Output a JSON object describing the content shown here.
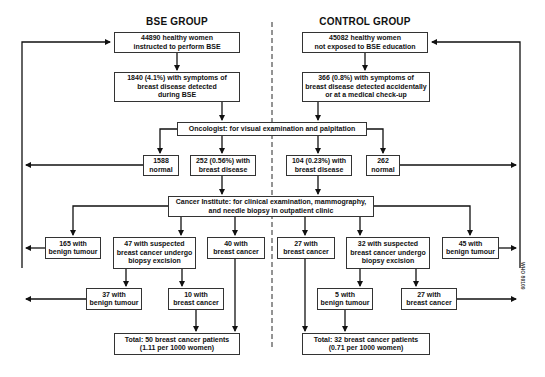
{
  "groups": {
    "bse": {
      "title": "BSE GROUP",
      "start": "44890 healthy women\ninstructed to perform BSE",
      "symptoms": "1840 (4.1%) with symptoms of\nbreast disease detected\nduring BSE",
      "normal": "1588\nnormal",
      "disease": "252 (0.56%) with\nbreast disease",
      "benign": "165 with\nbenign tumour",
      "suspected": "47 with suspected\nbreast cancer undergo\nbiopsy excision",
      "cancer": "40 with\nbreast cancer",
      "biopsy_benign": "37 with\nbenign tumour",
      "biopsy_cancer": "10 with\nbreast cancer",
      "total": "Total: 50 breast cancer patients\n(1.11 per 1000 women)"
    },
    "control": {
      "title": "CONTROL GROUP",
      "start": "45082 healthy women\nnot exposed to BSE education",
      "symptoms": "366 (0.8%) with symptoms of\nbreast disease detected accidentally\nor at a medical check-up",
      "disease": "104 (0.23%) with\nbreast disease",
      "normal": "262\nnormal",
      "cancer": "27 with\nbreast cancer",
      "suspected": "32 with suspected\nbreast cancer undergo\nbiopsy excision",
      "benign": "45 with\nbenign tumour",
      "biopsy_benign": "5 with\nbenign tumour",
      "biopsy_cancer": "27 with\nbreast cancer",
      "total": "Total: 32 breast cancer patients\n(0.71 per 1000 women)"
    }
  },
  "shared": {
    "oncologist": "Oncologist: for visual examination and palpitation",
    "cancer_institute": "Cancer Institute: for clinical examination, mammography,\nand needle biopsy in outpatient clinic"
  },
  "watermark": "WHO 89109"
}
